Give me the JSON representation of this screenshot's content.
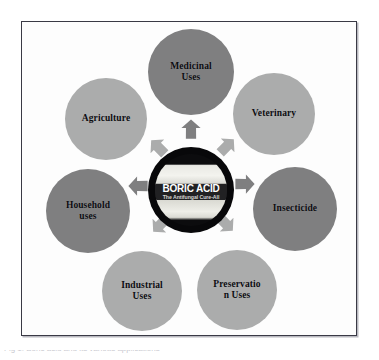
{
  "figure": {
    "type": "hub-and-spoke-diagram",
    "background_color": "#ffffff",
    "panel_border_color": "#3a3a45",
    "caption": "Fig 1: Boric acid and its various applications"
  },
  "hub": {
    "title": "BORIC ACID",
    "subtitle": "The Antifungal Cure-All",
    "ring_color": "#08080a",
    "band_color": "#212123",
    "title_color": "#ffffff",
    "subtitle_color": "#d6d6d6"
  },
  "palette": {
    "node_dark": "#7f7f80",
    "node_light": "#abacac",
    "arrow_dark": "#7f7f80",
    "arrow_light": "#abacac",
    "label_color": "#0c0c10"
  },
  "nodes": [
    {
      "label": "Medicinal\nUses",
      "tone": "dark",
      "position": "top",
      "size": 86,
      "x": 147,
      "y": 28
    },
    {
      "label": "Veterinary",
      "tone": "light",
      "position": "top-right",
      "size": 82,
      "x": 232,
      "y": 72
    },
    {
      "label": "Insecticide",
      "tone": "dark",
      "position": "right",
      "size": 84,
      "x": 252,
      "y": 166
    },
    {
      "label": "Preservatio\nn Uses",
      "tone": "light",
      "position": "bottom-right",
      "size": 80,
      "x": 196,
      "y": 249
    },
    {
      "label": "Industrial\nUses",
      "tone": "light",
      "position": "bottom-left",
      "size": 80,
      "x": 101,
      "y": 250
    },
    {
      "label": "Household\nuses",
      "tone": "dark",
      "position": "left",
      "size": 84,
      "x": 45,
      "y": 168
    },
    {
      "label": "Agriculture",
      "tone": "light",
      "position": "top-left",
      "size": 82,
      "x": 64,
      "y": 77
    }
  ],
  "arrows": [
    {
      "target": "Medicinal Uses",
      "rotation": 0,
      "tone": "dark",
      "x": 179,
      "y": 117
    },
    {
      "target": "Veterinary",
      "rotation": 45,
      "tone": "light",
      "x": 215,
      "y": 134
    },
    {
      "target": "Insecticide",
      "rotation": 90,
      "tone": "dark",
      "x": 233,
      "y": 172
    },
    {
      "target": "Preservation Uses",
      "rotation": 135,
      "tone": "light",
      "x": 214,
      "y": 212
    },
    {
      "target": "Industrial Uses",
      "rotation": 225,
      "tone": "light",
      "x": 148,
      "y": 213
    },
    {
      "target": "Household uses",
      "rotation": 270,
      "tone": "dark",
      "x": 126,
      "y": 174
    },
    {
      "target": "Agriculture",
      "rotation": 315,
      "tone": "light",
      "x": 146,
      "y": 135
    }
  ]
}
